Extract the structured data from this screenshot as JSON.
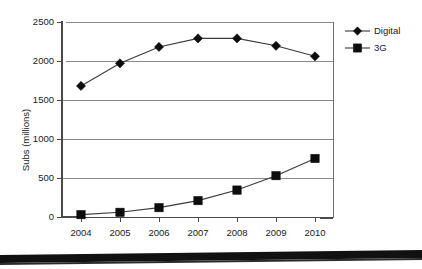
{
  "chart_data": {
    "type": "line",
    "title": "",
    "xlabel": "",
    "ylabel": "Subs (millions)",
    "categories": [
      "2004",
      "2005",
      "2006",
      "2007",
      "2008",
      "2009",
      "2010"
    ],
    "x": [
      2004,
      2005,
      2006,
      2007,
      2008,
      2009,
      2010
    ],
    "series": [
      {
        "name": "Digital",
        "marker": "diamond",
        "color": "#0d0d0d",
        "values": [
          1680,
          1970,
          2180,
          2290,
          2290,
          2195,
          2060
        ]
      },
      {
        "name": "3G",
        "marker": "square",
        "color": "#0d0d0d",
        "values": [
          30,
          60,
          120,
          210,
          345,
          530,
          750
        ]
      }
    ],
    "ylim": [
      0,
      2500
    ],
    "yticks": [
      0,
      500,
      1000,
      1500,
      2000,
      2500
    ],
    "ytick_labels": [
      "0",
      "500",
      "1000",
      "1500",
      "2000",
      "2500"
    ],
    "grid": true,
    "grid_axis": "y",
    "legend_position": "right",
    "legend_entries": [
      "Digital",
      "3G"
    ]
  },
  "axes": {
    "y_title": "Subs (millions)",
    "y_tick_labels": [
      "2500",
      "2000",
      "1500",
      "1000",
      "500",
      "0"
    ],
    "x_tick_labels": [
      "2004",
      "2005",
      "2006",
      "2007",
      "2008",
      "2009",
      "2010"
    ]
  },
  "legend": {
    "items": [
      {
        "label": "Digital",
        "marker": "diamond-marker"
      },
      {
        "label": "3G",
        "marker": "square-marker"
      }
    ]
  }
}
